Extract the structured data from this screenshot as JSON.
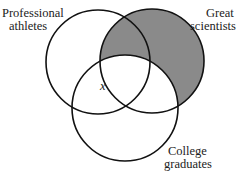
{
  "diagram": {
    "type": "venn",
    "sets": [
      {
        "name": "Professional athletes",
        "line1": "Professional",
        "line2": "athletes",
        "cx": 98,
        "cy": 62,
        "r": 52
      },
      {
        "name": "Great scientists",
        "line1": "Great",
        "line2": "scientists",
        "cx": 152,
        "cy": 61,
        "r": 52
      },
      {
        "name": "College graduates",
        "line1": "College",
        "line2": "graduates",
        "cx": 125,
        "cy": 108,
        "r": 53
      }
    ],
    "shaded_region": "Great scientists minus College graduates",
    "shade_color": "#8a8a8a",
    "stroke_color": "#111111",
    "marker": {
      "label": "x",
      "region": "Professional athletes ∩ College graduates, outside Great scientists"
    }
  }
}
